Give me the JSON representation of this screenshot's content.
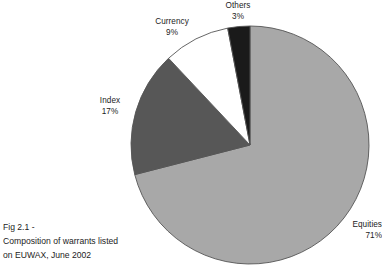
{
  "figure": {
    "caption_lines": [
      "Fig 2.1 -",
      "Composition of warrants listed",
      "on EUWAX, June 2002"
    ]
  },
  "labels": {
    "others": {
      "name": "Others",
      "value": "3%"
    },
    "currency": {
      "name": "Currency",
      "value": "9%"
    },
    "index": {
      "name": "Index",
      "value": "17%"
    },
    "equities": {
      "name": "Equities",
      "value": "71%"
    }
  },
  "chart_data": {
    "type": "pie",
    "title": "Composition of warrants listed on EUWAX, June 2002",
    "xlabel": "",
    "ylabel": "",
    "categories": [
      "Equities",
      "Index",
      "Currency",
      "Others"
    ],
    "values": [
      71,
      17,
      9,
      3
    ],
    "value_unit": "%",
    "value_labels": [
      "71%",
      "17%",
      "9%",
      "3%"
    ],
    "colors": [
      "#a8a8a8",
      "#575757",
      "#ffffff",
      "#1a1a1a"
    ],
    "stroke_color": "#555555",
    "start_angle_deg": 0,
    "direction": "clockwise",
    "legend": "none",
    "labels_position": "outside",
    "grid": false,
    "center_x": 250,
    "center_y": 145,
    "radius": 119
  }
}
